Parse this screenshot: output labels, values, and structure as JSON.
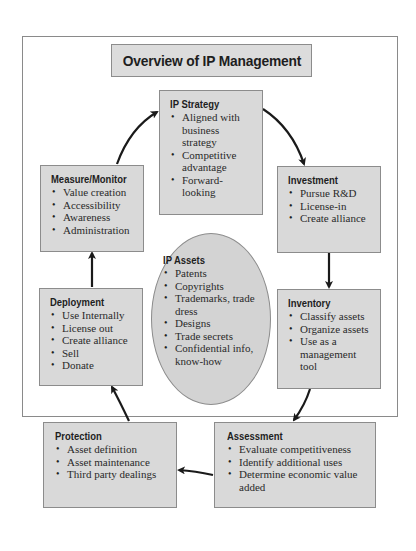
{
  "title": "Overview of IP Management",
  "center": {
    "title": "IP Assets",
    "items": [
      "Patents",
      "Copyrights",
      "Trademarks, trade dress",
      "Designs",
      "Trade secrets",
      "Confidential info, know-how"
    ]
  },
  "stages": {
    "strategy": {
      "title": "IP Strategy",
      "items": [
        "Aligned with business strategy",
        "Competitive advantage",
        "Forward-looking"
      ]
    },
    "investment": {
      "title": "Investment",
      "items": [
        "Pursue R&D",
        "License-in",
        "Create alliance"
      ]
    },
    "inventory": {
      "title": "Inventory",
      "items": [
        "Classify assets",
        "Organize assets",
        "Use as a management tool"
      ]
    },
    "assessment": {
      "title": "Assessment",
      "items": [
        "Evaluate competitiveness",
        "Identify additional uses",
        "Determine economic value added"
      ]
    },
    "protection": {
      "title": "Protection",
      "items": [
        "Asset definition",
        "Asset maintenance",
        "Third party dealings"
      ]
    },
    "deployment": {
      "title": "Deployment",
      "items": [
        "Use Internally",
        "License out",
        "Create alliance",
        "Sell",
        "Donate"
      ]
    },
    "measure": {
      "title": "Measure/Monitor",
      "items": [
        "Value creation",
        "Accessibility",
        "Awareness",
        "Administration"
      ]
    }
  },
  "flow": [
    "IP Strategy",
    "Investment",
    "Inventory",
    "Assessment",
    "Protection",
    "Deployment",
    "Measure/Monitor",
    "IP Strategy"
  ],
  "colors": {
    "box_fill": "#d9d9d9",
    "ellipse_fill": "#d3d3d3",
    "border": "#8c8c8c",
    "arrow": "#1a1a1a"
  }
}
